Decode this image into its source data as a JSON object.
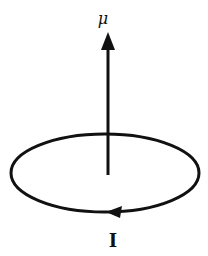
{
  "diagram": {
    "labels": {
      "moment": "μ",
      "current": "I"
    },
    "elements": {
      "loop": {
        "shape": "ellipse",
        "cx": 105,
        "cy": 173,
        "rx": 94,
        "ry": 39
      },
      "moment_vector": {
        "direction": "up",
        "x": 108,
        "y_start": 175,
        "y_end": 32
      },
      "current_arrow": {
        "direction": "left",
        "position": "bottom of loop"
      }
    },
    "colors": {
      "stroke": "#111111",
      "background": "#ffffff"
    }
  }
}
